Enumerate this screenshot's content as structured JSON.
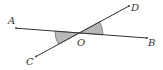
{
  "diagram": {
    "type": "intersecting-lines-angles",
    "labels": {
      "A": "A",
      "B": "B",
      "C": "C",
      "D": "D",
      "O": "O"
    },
    "points": {
      "A": [
        16,
        28
      ],
      "B": [
        147,
        38
      ],
      "C": [
        36,
        56
      ],
      "D": [
        129,
        6
      ],
      "O": [
        79,
        33
      ]
    },
    "shaded_angles": [
      "AOC",
      "BOD"
    ],
    "colors": {
      "line": "#333333",
      "shade": "#b8b8b8",
      "label": "#333333"
    }
  }
}
